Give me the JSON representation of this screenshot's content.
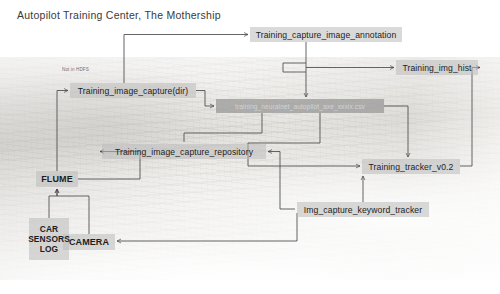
{
  "title": "Autopilot Training Center, The Mothership",
  "annotations": {
    "not_in_hdfs": "Not in HDFS"
  },
  "nodes": [
    {
      "id": "training_capture_image_annotation",
      "label": "Training_capture_image_annotation",
      "style": "plain",
      "x": 250,
      "y": 27,
      "w": 152,
      "h": 15
    },
    {
      "id": "training_img_hist",
      "label": "Training_img_hist",
      "style": "plain",
      "x": 396,
      "y": 60,
      "w": 82,
      "h": 15
    },
    {
      "id": "training_image_capture_dir",
      "label": "Training_image_capture(dir)",
      "style": "plain",
      "x": 70,
      "y": 83,
      "w": 126,
      "h": 15
    },
    {
      "id": "training_neuralnet_csv",
      "label": "training_neuralnet_autopilot_axe_xxxix.csv",
      "style": "dark",
      "x": 216,
      "y": 99,
      "w": 168,
      "h": 14
    },
    {
      "id": "training_image_capture_repository",
      "label": "Training_image_capture_repository",
      "style": "plain",
      "x": 102,
      "y": 144,
      "w": 164,
      "h": 15
    },
    {
      "id": "training_tracker_v02",
      "label": "Training_tracker_v0.2",
      "style": "plain",
      "x": 362,
      "y": 159,
      "w": 98,
      "h": 15
    },
    {
      "id": "img_capture_keyword_tracker",
      "label": "Img_capture_keyword_tracker",
      "style": "plain",
      "x": 297,
      "y": 202,
      "w": 132,
      "h": 15
    },
    {
      "id": "flume",
      "label": "FLUME",
      "style": "bold",
      "x": 36,
      "y": 171,
      "w": 42,
      "h": 16
    },
    {
      "id": "camera",
      "label": "CAMERA",
      "style": "bold",
      "x": 63,
      "y": 234,
      "w": 52,
      "h": 16
    },
    {
      "id": "car_sensors_log",
      "label": "CAR SENSORS LOG",
      "lines": [
        "CAR",
        "SENSORS",
        "LOG"
      ],
      "style": "multiline",
      "x": 29,
      "y": 218,
      "w": 40,
      "h": 42
    }
  ],
  "edges": [
    {
      "from": "flume",
      "to": "training_image_capture_dir"
    },
    {
      "from": "training_image_capture_dir",
      "to": "training_capture_image_annotation"
    },
    {
      "from": "training_image_capture_dir",
      "to": "training_neuralnet_csv"
    },
    {
      "from": "training_capture_image_annotation",
      "to": "training_img_hist"
    },
    {
      "from": "training_capture_image_annotation",
      "to": "training_neuralnet_csv"
    },
    {
      "from": "flume",
      "to": "training_image_capture_repository"
    },
    {
      "from": "training_neuralnet_csv",
      "to": "training_image_capture_repository"
    },
    {
      "from": "training_neuralnet_csv",
      "to": "training_tracker_v0.2"
    },
    {
      "from": "training_tracker_v0.2",
      "to": "training_img_hist"
    },
    {
      "from": "img_capture_keyword_tracker",
      "to": "training_tracker_v0.2"
    },
    {
      "from": "img_capture_keyword_tracker",
      "to": "training_image_capture_repository"
    },
    {
      "from": "camera",
      "to": "flume"
    },
    {
      "from": "car_sensors_log",
      "to": "flume"
    },
    {
      "from": "img_capture_keyword_tracker",
      "to": "camera"
    }
  ],
  "colors": {
    "node_fill": "#bcbcbc",
    "node_fill_dark": "#969696",
    "text": "#1d1d1d",
    "line": "#4a4a4a",
    "title": "#3a3a3a"
  }
}
